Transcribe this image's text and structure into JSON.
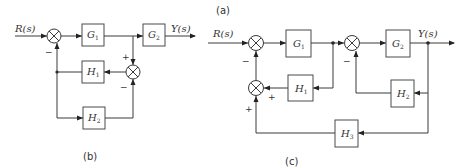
{
  "captions": {
    "a": "(a)",
    "b": "(b)",
    "c": "(c)"
  },
  "diagram_b": {
    "input_label": "R(s)",
    "output_label": "Y(s)",
    "blocks": [
      {
        "id": "G1",
        "letter": "G",
        "sub": "1"
      },
      {
        "id": "G2",
        "letter": "G",
        "sub": "2"
      },
      {
        "id": "H1",
        "letter": "H",
        "sub": "1"
      },
      {
        "id": "H2",
        "letter": "H",
        "sub": "2"
      }
    ],
    "signs": {
      "sum1_bottom": "−",
      "sum2_top": "+",
      "sum2_bottom": "−"
    }
  },
  "diagram_c": {
    "input_label": "R(s)",
    "output_label": "Y(s)",
    "blocks": [
      {
        "id": "G1",
        "letter": "G",
        "sub": "1"
      },
      {
        "id": "G2",
        "letter": "G",
        "sub": "2"
      },
      {
        "id": "H1",
        "letter": "H",
        "sub": "1"
      },
      {
        "id": "H2",
        "letter": "H",
        "sub": "2"
      },
      {
        "id": "H3",
        "letter": "H",
        "sub": "3"
      }
    ],
    "signs": {
      "sum1_bottom": "−",
      "sum2_bottom": "−",
      "sum3_right": "+",
      "sum3_bottom": "+"
    }
  }
}
